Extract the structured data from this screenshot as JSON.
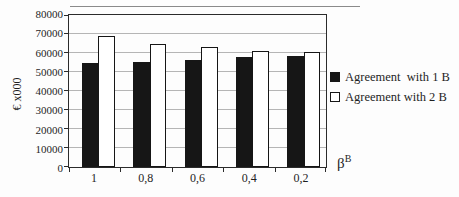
{
  "figure": {
    "background": "#fdfdfd",
    "ink": "#1f1f1f",
    "gridline_color": "#b5b5b5"
  },
  "chart_data": {
    "type": "bar",
    "title": "",
    "categories": [
      "1",
      "0,8",
      "0,6",
      "0,4",
      "0,2"
    ],
    "series": [
      {
        "name": "Agreement  with 1 B",
        "fill": "#161616",
        "values": [
          54500,
          55200,
          56500,
          57700,
          58300
        ]
      },
      {
        "name": "Agreement with 2 B",
        "fill": "#ffffff",
        "values": [
          68800,
          64700,
          63100,
          61200,
          60400
        ]
      }
    ],
    "ylabel": "€ x000",
    "xlabel_base": "β",
    "xlabel_sup": "B",
    "ylim": [
      0,
      80000
    ],
    "ytick_step": 10000,
    "yticks": [
      0,
      10000,
      20000,
      30000,
      40000,
      50000,
      60000,
      70000,
      80000
    ],
    "grid": "horizontal",
    "legend_position": "right"
  }
}
